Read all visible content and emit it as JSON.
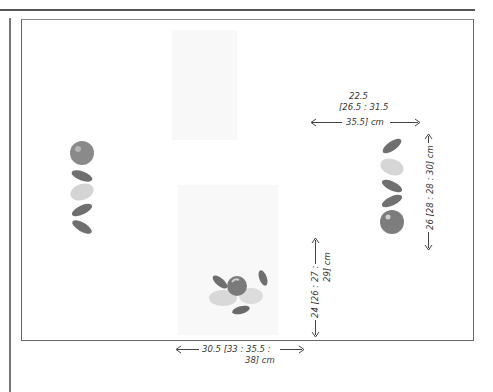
{
  "diagram": {
    "top_right_dimension": {
      "line1": "22.5",
      "line2": "[26.5 : 31.5",
      "line3": "35.5] cm"
    },
    "right_vertical_dimension": "26 [28 : 28 : 30] cm",
    "center_vertical_dimension": {
      "line1": "24 [26 : 27 :",
      "line2": "29] cm"
    },
    "bottom_dimension": {
      "line1": "30.5 [33 : 35.5 :",
      "line2": "38] cm"
    },
    "motifs": {
      "left_column": [
        "apple",
        "leaf",
        "pale-leaf",
        "leaf",
        "leaf"
      ],
      "right_column": [
        "leaf",
        "pale-leaf",
        "leaf",
        "leaf",
        "apple"
      ],
      "bottom_cluster": [
        "leaf",
        "apple",
        "pale-fruit",
        "leaf",
        "leaf"
      ]
    },
    "colors": {
      "leaf": "#6f6f6f",
      "apple": "#7d7d7d",
      "pale": "#d4d4d4",
      "frame": "#666666"
    }
  },
  "caption": {
    "text": ""
  }
}
